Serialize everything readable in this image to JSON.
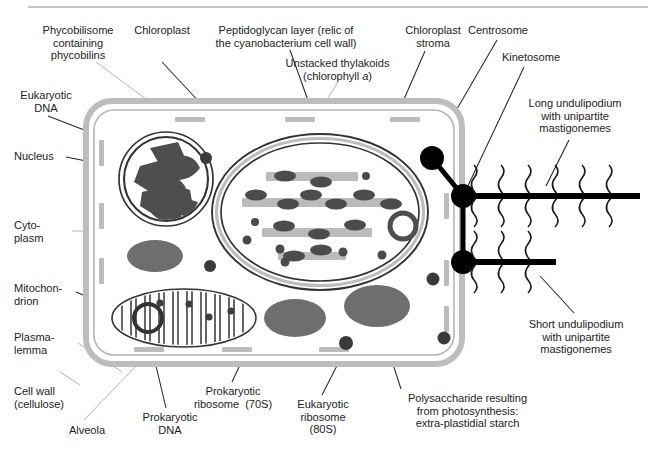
{
  "figure": {
    "kind": "biology-cell-diagram",
    "top_rule_color": "#b0b0b0",
    "background": "#ffffff"
  },
  "colors": {
    "ink": "#1d1d1d",
    "leader_dark": "#262626",
    "leader_light": "#a8a8a8",
    "cell_wall": "#bdbdbd",
    "plasmalemma": "#b5b5b5",
    "alveola": "#bcbcbc",
    "organelle_outline": "#333333",
    "chromatin": "#4e4e4e",
    "thylakoid": "#bbbbbb",
    "phycobilisome": "#4c4c4c",
    "starch": "#6e6e6e",
    "ribosome_70s": "#4a4a4a",
    "ribosome_80s": "#3a3a3a",
    "centrosome": "#000000",
    "undulipodium": "#000000"
  },
  "labels": [
    {
      "id": "phycobilisome",
      "name": "label-phycobilisome",
      "lines": [
        "Phycobilisome",
        "containing",
        "phycobilins"
      ],
      "align": "center",
      "x": 18,
      "y": 24,
      "w": 120
    },
    {
      "id": "chloroplast",
      "name": "label-chloroplast",
      "lines": [
        "Chloroplast"
      ],
      "align": "center",
      "x": 125,
      "y": 24,
      "w": 74
    },
    {
      "id": "peptidoglycan",
      "name": "label-peptidoglycan-layer",
      "lines": [
        "Peptidoglycan layer (relic of",
        "the cyanobacterium cell wall)"
      ],
      "align": "center",
      "x": 200,
      "y": 24,
      "w": 170
    },
    {
      "id": "unstacked-thylakoids",
      "name": "label-unstacked-thylakoids",
      "lines": [
        "Unstacked thylakoids",
        "(chlorophyll <i>a</i>)"
      ],
      "align": "center",
      "x": 275,
      "y": 57,
      "w": 125
    },
    {
      "id": "chloroplast-stroma",
      "name": "label-chloroplast-stroma",
      "lines": [
        "Chloroplast",
        "stroma"
      ],
      "align": "center",
      "x": 395,
      "y": 24,
      "w": 76
    },
    {
      "id": "centrosome",
      "name": "label-centrosome",
      "lines": [
        "Centrosome"
      ],
      "align": "center",
      "x": 460,
      "y": 24,
      "w": 76
    },
    {
      "id": "kinetosome",
      "name": "label-kinetosome",
      "lines": [
        "Kinetosome"
      ],
      "align": "center",
      "x": 493,
      "y": 51,
      "w": 76
    },
    {
      "id": "eukaryotic-dna",
      "name": "label-eukaryotic-dna",
      "lines": [
        "Eukaryotic",
        "DNA"
      ],
      "align": "center",
      "x": 8,
      "y": 89,
      "w": 76
    },
    {
      "id": "nucleus",
      "name": "label-nucleus",
      "lines": [
        "Nucleus"
      ],
      "align": "left",
      "x": 14,
      "y": 150,
      "w": 60
    },
    {
      "id": "cytoplasm",
      "name": "label-cytoplasm",
      "lines": [
        "Cyto-",
        "plasm"
      ],
      "align": "left",
      "x": 14,
      "y": 219,
      "w": 56
    },
    {
      "id": "mitochondrion",
      "name": "label-mitochondrion",
      "lines": [
        "Mitochon-",
        "drion"
      ],
      "align": "left",
      "x": 14,
      "y": 282,
      "w": 66
    },
    {
      "id": "plasmalemma",
      "name": "label-plasmalemma",
      "lines": [
        "Plasma-",
        "lemma"
      ],
      "align": "left",
      "x": 14,
      "y": 331,
      "w": 56
    },
    {
      "id": "cell-wall",
      "name": "label-cell-wall",
      "lines": [
        "Cell wall",
        "(cellulose)"
      ],
      "align": "left",
      "x": 14,
      "y": 385,
      "w": 70
    },
    {
      "id": "alveola",
      "name": "label-alveola",
      "lines": [
        "Alveola"
      ],
      "align": "center",
      "x": 56,
      "y": 424,
      "w": 62
    },
    {
      "id": "prokaryotic-dna",
      "name": "label-prokaryotic-dna",
      "lines": [
        "Prokaryotic",
        "DNA"
      ],
      "align": "center",
      "x": 130,
      "y": 411,
      "w": 80
    },
    {
      "id": "prokaryotic-ribosome",
      "name": "label-prokaryotic-ribosome-70s",
      "lines": [
        "Prokaryotic",
        "ribosome  (70S)"
      ],
      "align": "center",
      "x": 178,
      "y": 385,
      "w": 110
    },
    {
      "id": "eukaryotic-ribosome",
      "name": "label-eukaryotic-ribosome-80s",
      "lines": [
        "Eukaryotic",
        "ribosome",
        "(80S)"
      ],
      "align": "center",
      "x": 285,
      "y": 398,
      "w": 76
    },
    {
      "id": "polysaccharide",
      "name": "label-polysaccharide-starch",
      "lines": [
        "Polysaccharide resulting",
        "from photosynthesis:",
        "extra-plastidial starch"
      ],
      "align": "center",
      "x": 390,
      "y": 392,
      "w": 155
    },
    {
      "id": "long-undulipodium",
      "name": "label-long-undulipodium",
      "lines": [
        "Long undulipodium",
        "with unipartite",
        "mastigonemes"
      ],
      "align": "center",
      "x": 510,
      "y": 97,
      "w": 130
    },
    {
      "id": "short-undulipodium",
      "name": "label-short-undulipodium",
      "lines": [
        "Short undulipodium",
        "with unipartite",
        "mastigonemes"
      ],
      "align": "center",
      "x": 508,
      "y": 318,
      "w": 136
    }
  ],
  "structures": {
    "cell": {
      "x": 86,
      "y": 101,
      "w": 376,
      "h": 263,
      "radius": 26
    },
    "nucleus": {
      "cx": 166,
      "cy": 179,
      "r": 47
    },
    "chloroplast": {
      "cx": 320,
      "cy": 212,
      "rx": 108,
      "ry": 78
    },
    "mitochondrion": {
      "cx": 184,
      "cy": 318,
      "rx": 72,
      "ry": 29
    },
    "starch_granules": [
      {
        "cx": 155,
        "cy": 256,
        "rx": 28,
        "ry": 16
      },
      {
        "cx": 295,
        "cy": 318,
        "rx": 31,
        "ry": 19
      },
      {
        "cx": 377,
        "cy": 306,
        "rx": 33,
        "ry": 21
      }
    ],
    "centrosome": {
      "cx": 432,
      "cy": 158,
      "r": 12
    },
    "kinetosomes": [
      {
        "cx": 463,
        "cy": 196,
        "r": 12
      },
      {
        "cx": 463,
        "cy": 262,
        "r": 12
      }
    ],
    "undulipodia": [
      {
        "id": "long",
        "y": 196,
        "x1": 463,
        "x2": 640,
        "mastigoneme_pairs": 6
      },
      {
        "id": "short",
        "y": 262,
        "x1": 463,
        "x2": 556,
        "mastigoneme_pairs": 3
      }
    ],
    "thylakoids": [
      {
        "x": 266,
        "y": 172,
        "w": 92,
        "h": 9,
        "phyco": [
          [
            285,
            176
          ],
          [
            320,
            181
          ]
        ]
      },
      {
        "x": 242,
        "y": 198,
        "w": 155,
        "h": 9,
        "phyco": [
          [
            255,
            195
          ],
          [
            288,
            203
          ],
          [
            310,
            194
          ],
          [
            335,
            203
          ],
          [
            363,
            194
          ],
          [
            390,
            203
          ]
        ]
      },
      {
        "x": 262,
        "y": 228,
        "w": 110,
        "h": 9,
        "phyco": [
          [
            283,
            226
          ],
          [
            318,
            233
          ],
          [
            354,
            224
          ]
        ]
      },
      {
        "x": 278,
        "y": 252,
        "w": 68,
        "h": 8,
        "phyco": [
          [
            293,
            255
          ],
          [
            320,
            249
          ]
        ]
      }
    ],
    "prokaryotic_dna_rings": [
      {
        "cx": 403,
        "cy": 226,
        "r": 13,
        "sw": 5,
        "color": "#4e4e4e"
      },
      {
        "cx": 148,
        "cy": 318,
        "r": 14,
        "sw": 4,
        "color": "#333333"
      }
    ],
    "ribosomes_70s_chloroplast": [
      [
        254,
        224
      ],
      [
        279,
        248
      ],
      [
        282,
        261
      ],
      [
        341,
        251
      ],
      [
        381,
        254
      ],
      [
        366,
        176
      ],
      [
        246,
        239
      ]
    ],
    "ribosomes_mitochondrion": [
      [
        157,
        303
      ],
      [
        187,
        305
      ],
      [
        207,
        316
      ],
      [
        228,
        311
      ]
    ],
    "ribosomes_80s_cytoplasm": [
      [
        205,
        158
      ],
      [
        209,
        265
      ],
      [
        345,
        342
      ],
      [
        432,
        278
      ],
      [
        443,
        337
      ],
      [
        249,
        167
      ]
    ],
    "alveolae_top": [
      [
        189,
        120
      ],
      [
        299,
        120
      ],
      [
        404,
        120
      ]
    ],
    "alveolae_bottom": [
      [
        148,
        350
      ],
      [
        236,
        350
      ],
      [
        333,
        350
      ]
    ],
    "alveolae_left": [
      [
        96,
        152
      ],
      [
        96,
        213
      ],
      [
        96,
        268
      ]
    ],
    "alveolae_right": [
      [
        450,
        205
      ],
      [
        450,
        272
      ],
      [
        450,
        318
      ]
    ]
  }
}
